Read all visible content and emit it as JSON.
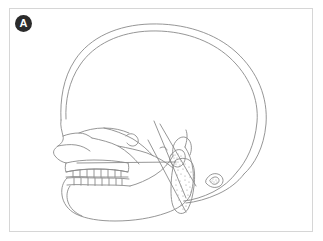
{
  "figure": {
    "panel_label": "A",
    "caption": "",
    "badge_color": "#2b2b2b",
    "badge_text_color": "#ffffff",
    "frame_color": "#d6d6d6",
    "background_color": "#ffffff",
    "line_color": "#8a8a8a",
    "stipple_color": "#9a9a9a",
    "anatomy_parts": [
      "cranial-vault-outer-table",
      "cranial-vault-inner-table",
      "frontal-bone-profile",
      "nasal-bone",
      "orbital-rim",
      "maxilla",
      "maxillary-teeth",
      "mandibular-teeth",
      "mandible-body",
      "mandibular-ramus",
      "mandibular-condyle",
      "cranial-base",
      "sella-turcica",
      "posterior-cranial-outline",
      "cervical-vertebra-upper",
      "cervical-vertebra-lower",
      "hyoid-bone"
    ]
  }
}
